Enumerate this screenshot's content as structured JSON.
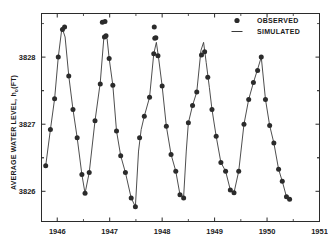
{
  "chart_data": {
    "type": "scatter",
    "title": "",
    "xlabel": "",
    "ylabel": "AVERAGE WATER LEVEL, h",
    "ylabel_subscript": "o",
    "ylabel_units": "(FT)",
    "xlim": [
      1945.7,
      1951.0
    ],
    "ylim": [
      3825.55,
      3828.65
    ],
    "xticks": [
      1946,
      1947,
      1948,
      1949,
      1950,
      1951
    ],
    "xtick_labels": [
      "1946",
      "1947",
      "1948",
      "1949",
      "1950",
      "1951"
    ],
    "yticks": [
      3826,
      3827,
      3828
    ],
    "ytick_labels": [
      "3826",
      "3827",
      "3828"
    ],
    "grid": false,
    "legend_position": "top-right",
    "legend": [
      {
        "label": "OBSERVED",
        "marker": "filled-circle",
        "color": "#2b2b2b"
      },
      {
        "label": "SIMULATED",
        "marker": "line",
        "color": "#3a3a3a"
      }
    ],
    "series": [
      {
        "name": "OBSERVED",
        "type": "scatter",
        "marker": "filled-circle",
        "color": "#2b2b2b",
        "points": [
          {
            "x": 1945.78,
            "y": 3826.38
          },
          {
            "x": 1945.87,
            "y": 3826.92
          },
          {
            "x": 1945.95,
            "y": 3827.38
          },
          {
            "x": 1946.02,
            "y": 3828.0
          },
          {
            "x": 1946.1,
            "y": 3828.41
          },
          {
            "x": 1946.14,
            "y": 3828.45
          },
          {
            "x": 1946.22,
            "y": 3827.72
          },
          {
            "x": 1946.3,
            "y": 3827.22
          },
          {
            "x": 1946.38,
            "y": 3826.8
          },
          {
            "x": 1946.47,
            "y": 3826.25
          },
          {
            "x": 1946.53,
            "y": 3825.97
          },
          {
            "x": 1946.61,
            "y": 3826.28
          },
          {
            "x": 1946.72,
            "y": 3827.05
          },
          {
            "x": 1946.82,
            "y": 3827.6
          },
          {
            "x": 1946.9,
            "y": 3828.3
          },
          {
            "x": 1946.93,
            "y": 3828.32
          },
          {
            "x": 1946.99,
            "y": 3827.98
          },
          {
            "x": 1947.06,
            "y": 3827.58
          },
          {
            "x": 1947.13,
            "y": 3826.9
          },
          {
            "x": 1947.21,
            "y": 3826.53
          },
          {
            "x": 1947.3,
            "y": 3826.28
          },
          {
            "x": 1947.41,
            "y": 3825.9
          },
          {
            "x": 1947.49,
            "y": 3825.77
          },
          {
            "x": 1947.57,
            "y": 3826.8
          },
          {
            "x": 1947.66,
            "y": 3827.12
          },
          {
            "x": 1947.76,
            "y": 3827.4
          },
          {
            "x": 1947.84,
            "y": 3828.05
          },
          {
            "x": 1947.88,
            "y": 3828.29
          },
          {
            "x": 1947.92,
            "y": 3828.02
          },
          {
            "x": 1948.0,
            "y": 3827.57
          },
          {
            "x": 1948.08,
            "y": 3826.97
          },
          {
            "x": 1948.17,
            "y": 3826.55
          },
          {
            "x": 1948.26,
            "y": 3826.3
          },
          {
            "x": 1948.34,
            "y": 3825.95
          },
          {
            "x": 1948.41,
            "y": 3825.9
          },
          {
            "x": 1948.5,
            "y": 3827.02
          },
          {
            "x": 1948.58,
            "y": 3827.28
          },
          {
            "x": 1948.66,
            "y": 3827.48
          },
          {
            "x": 1948.75,
            "y": 3828.03
          },
          {
            "x": 1948.81,
            "y": 3828.08
          },
          {
            "x": 1948.87,
            "y": 3827.7
          },
          {
            "x": 1948.95,
            "y": 3827.22
          },
          {
            "x": 1949.03,
            "y": 3826.82
          },
          {
            "x": 1949.12,
            "y": 3826.43
          },
          {
            "x": 1949.21,
            "y": 3826.3
          },
          {
            "x": 1949.3,
            "y": 3826.02
          },
          {
            "x": 1949.37,
            "y": 3825.98
          },
          {
            "x": 1949.46,
            "y": 3826.3
          },
          {
            "x": 1949.56,
            "y": 3827.0
          },
          {
            "x": 1949.65,
            "y": 3827.37
          },
          {
            "x": 1949.74,
            "y": 3827.62
          },
          {
            "x": 1949.82,
            "y": 3827.8
          },
          {
            "x": 1949.89,
            "y": 3828.0
          },
          {
            "x": 1949.97,
            "y": 3827.37
          },
          {
            "x": 1950.05,
            "y": 3826.98
          },
          {
            "x": 1950.13,
            "y": 3826.72
          },
          {
            "x": 1950.22,
            "y": 3826.33
          },
          {
            "x": 1950.29,
            "y": 3826.15
          },
          {
            "x": 1950.37,
            "y": 3825.92
          },
          {
            "x": 1950.43,
            "y": 3825.88
          }
        ],
        "outliers": [
          {
            "x": 1946.86,
            "y": 3828.52
          },
          {
            "x": 1946.91,
            "y": 3828.53
          },
          {
            "x": 1947.85,
            "y": 3828.45
          },
          {
            "x": 1947.86,
            "y": 3828.28
          }
        ]
      },
      {
        "name": "SIMULATED",
        "type": "line",
        "color": "#3a3a3a",
        "points": [
          {
            "x": 1945.78,
            "y": 3826.38
          },
          {
            "x": 1945.87,
            "y": 3826.92
          },
          {
            "x": 1945.95,
            "y": 3827.38
          },
          {
            "x": 1946.02,
            "y": 3828.0
          },
          {
            "x": 1946.09,
            "y": 3828.44
          },
          {
            "x": 1946.15,
            "y": 3828.3
          },
          {
            "x": 1946.22,
            "y": 3827.72
          },
          {
            "x": 1946.3,
            "y": 3827.22
          },
          {
            "x": 1946.38,
            "y": 3826.8
          },
          {
            "x": 1946.47,
            "y": 3826.25
          },
          {
            "x": 1946.53,
            "y": 3825.97
          },
          {
            "x": 1946.61,
            "y": 3826.28
          },
          {
            "x": 1946.72,
            "y": 3827.05
          },
          {
            "x": 1946.82,
            "y": 3827.62
          },
          {
            "x": 1946.89,
            "y": 3828.3
          },
          {
            "x": 1946.95,
            "y": 3828.28
          },
          {
            "x": 1946.99,
            "y": 3827.98
          },
          {
            "x": 1947.06,
            "y": 3827.58
          },
          {
            "x": 1947.13,
            "y": 3826.9
          },
          {
            "x": 1947.21,
            "y": 3826.53
          },
          {
            "x": 1947.3,
            "y": 3826.28
          },
          {
            "x": 1947.41,
            "y": 3825.9
          },
          {
            "x": 1947.49,
            "y": 3825.77
          },
          {
            "x": 1947.55,
            "y": 3826.6
          },
          {
            "x": 1947.6,
            "y": 3826.92
          },
          {
            "x": 1947.66,
            "y": 3827.12
          },
          {
            "x": 1947.76,
            "y": 3827.4
          },
          {
            "x": 1947.84,
            "y": 3828.05
          },
          {
            "x": 1947.89,
            "y": 3828.22
          },
          {
            "x": 1947.93,
            "y": 3828.0
          },
          {
            "x": 1948.0,
            "y": 3827.57
          },
          {
            "x": 1948.08,
            "y": 3826.97
          },
          {
            "x": 1948.17,
            "y": 3826.55
          },
          {
            "x": 1948.26,
            "y": 3826.3
          },
          {
            "x": 1948.34,
            "y": 3825.95
          },
          {
            "x": 1948.41,
            "y": 3825.92
          },
          {
            "x": 1948.46,
            "y": 3826.6
          },
          {
            "x": 1948.5,
            "y": 3827.02
          },
          {
            "x": 1948.58,
            "y": 3827.28
          },
          {
            "x": 1948.66,
            "y": 3827.48
          },
          {
            "x": 1948.74,
            "y": 3828.1
          },
          {
            "x": 1948.79,
            "y": 3828.22
          },
          {
            "x": 1948.84,
            "y": 3827.92
          },
          {
            "x": 1948.9,
            "y": 3827.55
          },
          {
            "x": 1948.95,
            "y": 3827.22
          },
          {
            "x": 1949.03,
            "y": 3826.82
          },
          {
            "x": 1949.12,
            "y": 3826.43
          },
          {
            "x": 1949.21,
            "y": 3826.3
          },
          {
            "x": 1949.3,
            "y": 3826.02
          },
          {
            "x": 1949.37,
            "y": 3825.98
          },
          {
            "x": 1949.46,
            "y": 3826.3
          },
          {
            "x": 1949.56,
            "y": 3827.0
          },
          {
            "x": 1949.65,
            "y": 3827.37
          },
          {
            "x": 1949.74,
            "y": 3827.62
          },
          {
            "x": 1949.82,
            "y": 3827.82
          },
          {
            "x": 1949.89,
            "y": 3828.0
          },
          {
            "x": 1949.97,
            "y": 3827.37
          },
          {
            "x": 1950.05,
            "y": 3826.98
          },
          {
            "x": 1950.13,
            "y": 3826.72
          },
          {
            "x": 1950.22,
            "y": 3826.33
          },
          {
            "x": 1950.29,
            "y": 3826.15
          },
          {
            "x": 1950.37,
            "y": 3825.92
          },
          {
            "x": 1950.43,
            "y": 3825.88
          }
        ]
      }
    ]
  }
}
